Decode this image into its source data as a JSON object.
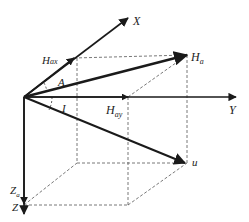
{
  "diagram": {
    "type": "3d-vector-decomposition",
    "colors": {
      "line": "#1a1a1a",
      "dashed": "#555555",
      "background": "#ffffff"
    },
    "labels": {
      "x_axis": "X",
      "y_axis": "Y",
      "z_axis": "Z",
      "h_ax": "H",
      "h_ax_sub": "ax",
      "h_ay": "H",
      "h_ay_sub": "ay",
      "h_a": "H",
      "h_a_sub": "a",
      "z_a": "Z",
      "z_a_sub": "a",
      "u": "u",
      "angle_a": "A",
      "angle_i": "I"
    }
  }
}
